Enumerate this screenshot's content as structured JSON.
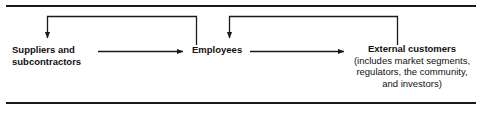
{
  "figure": {
    "colors": {
      "line": "#1a1a1a",
      "text": "#111111",
      "background": "#ffffff"
    }
  },
  "rules": {
    "top_label": "top-horizontal-rule",
    "bottom_label": "bottom-horizontal-rule"
  },
  "nodes": [
    {
      "id": "suppliers",
      "title_line1": "Suppliers and",
      "title_line2": "subcontractors"
    },
    {
      "id": "employees",
      "title": "Employees"
    },
    {
      "id": "customers",
      "title": "External customers",
      "sub_line1": "(includes market segments,",
      "sub_line2": "regulators, the community,",
      "sub_line3": "and investors)"
    }
  ],
  "connectors": [
    {
      "id": "suppliers-to-employees",
      "kind": "arrow-right",
      "from": "suppliers",
      "to": "employees"
    },
    {
      "id": "employees-to-customers",
      "kind": "arrow-right",
      "from": "employees",
      "to": "customers"
    },
    {
      "id": "employees-feedback-to-suppliers",
      "kind": "feedback-loop-arrow-down",
      "from": "employees",
      "to": "suppliers"
    },
    {
      "id": "customers-feedback-to-employees",
      "kind": "feedback-loop-arrow-down",
      "from": "customers",
      "to": "employees"
    }
  ]
}
